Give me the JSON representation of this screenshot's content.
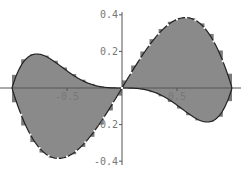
{
  "chart_data": {
    "type": "area",
    "title": "",
    "xlabel": "",
    "ylabel": "",
    "xlim": [
      -1,
      1
    ],
    "ylim": [
      -0.4,
      0.4
    ],
    "grid": false,
    "legend": null,
    "x_ticks": [
      -0.5,
      0.5
    ],
    "x_tick_labels": [
      "-0.5",
      "0.5"
    ],
    "y_ticks": [
      0.4,
      0.2,
      -0.2,
      -0.4
    ],
    "y_tick_labels": [
      "0.4",
      "0.2",
      "-0.2",
      "-0.4"
    ],
    "series": [
      {
        "name": "outer curve",
        "formula": "x(1-x^2)",
        "x": [
          -1,
          -0.75,
          -0.577,
          -0.5,
          -0.25,
          0,
          0.25,
          0.5,
          0.577,
          0.75,
          1
        ],
        "values": [
          0,
          -0.33,
          -0.385,
          -0.375,
          -0.234,
          0,
          0.234,
          0.375,
          0.385,
          0.33,
          0
        ]
      },
      {
        "name": "inner curve",
        "formula": "-x^3(1-x^2)",
        "x": [
          -1,
          -0.775,
          -0.75,
          -0.5,
          -0.25,
          0,
          0.25,
          0.5,
          0.75,
          0.775,
          1
        ],
        "values": [
          0,
          0.186,
          0.185,
          0.094,
          0.015,
          0,
          -0.015,
          -0.094,
          -0.185,
          -0.186,
          0
        ]
      }
    ],
    "fill_color": "#8a8a8a",
    "curve_color": "#222222",
    "axis_color": "#555555"
  }
}
